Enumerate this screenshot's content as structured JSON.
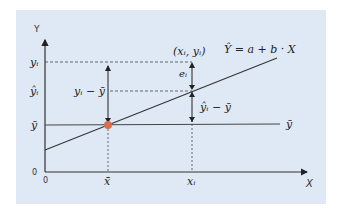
{
  "diagram": {
    "background_color": "#dfe9f5",
    "point_color": "#d9704a",
    "axes": {
      "x_label": "X",
      "y_label": "Y",
      "origin_x_label": "0",
      "origin_y_label": "0"
    },
    "y_ticks": {
      "yi": "yᵢ",
      "yhat_i": "ŷᵢ",
      "ybar": "ȳ"
    },
    "x_ticks": {
      "xbar": "x̄",
      "xi": "xᵢ"
    },
    "annotations": {
      "point": "(xᵢ, yᵢ)",
      "equation": "Ŷ = a + b · X",
      "residual": "eᵢ",
      "total_deviation": "yᵢ − ȳ",
      "explained_deviation": "ŷᵢ − ȳ",
      "mean_line_label": "ȳ"
    }
  }
}
